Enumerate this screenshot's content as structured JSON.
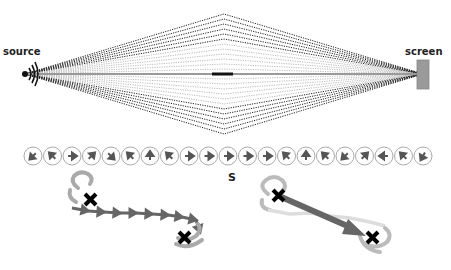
{
  "labels": {
    "source": "source",
    "screen": "screen",
    "s_label": "S"
  },
  "diagram": {
    "ray_count_per_side": 12,
    "phasor_directions_deg": [
      225,
      135,
      0,
      45,
      315,
      135,
      90,
      135,
      0,
      0,
      0,
      0,
      0,
      135,
      90,
      135,
      225,
      45,
      180,
      135,
      240
    ],
    "colors": {
      "ray_dark": "#222222",
      "ray_light": "#bbbbbb",
      "axis": "#999999",
      "screen_fill": "#9a9a9a",
      "phasor_arrow": "#555555",
      "circle": "#aaaaaa",
      "path_dark": "#666666",
      "path_light": "#aaaaaa",
      "path_faint": "#cccccc",
      "cross": "#000000",
      "big_arrow": "#666666"
    }
  }
}
